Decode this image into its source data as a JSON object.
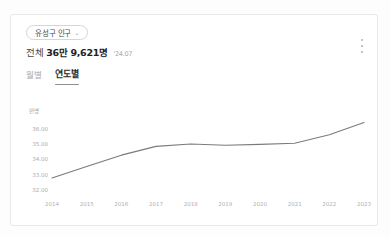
{
  "card": {
    "region_selector": {
      "label": "유성구 인구",
      "chevron": "chevron-down-icon"
    },
    "menu": {
      "label": "more-options"
    },
    "summary": {
      "prefix": "전체",
      "value": "36만 9,621명",
      "date": "'24.07"
    },
    "tabs": [
      {
        "label": "월별",
        "active": false
      },
      {
        "label": "연도별",
        "active": true
      }
    ]
  },
  "chart_data": {
    "type": "line",
    "title": "",
    "xlabel": "",
    "ylabel": "만명",
    "unit_label": "만명",
    "categories": [
      "2014",
      "2015",
      "2016",
      "2017",
      "2018",
      "2019",
      "2020",
      "2021",
      "2022",
      "2023"
    ],
    "series": [
      {
        "name": "유성구 인구",
        "values": [
          32.8,
          33.55,
          34.28,
          34.85,
          35.0,
          34.92,
          34.98,
          35.05,
          35.6,
          36.4
        ],
        "color": "#7b7b7b"
      }
    ],
    "yticks": [
      "36.00",
      "35.00",
      "34.00",
      "33.00",
      "32.00"
    ],
    "ytick_values": [
      36.0,
      35.0,
      34.0,
      33.0,
      32.0
    ],
    "ylim": [
      31.7,
      36.75
    ],
    "grid": false,
    "legend": "none"
  }
}
